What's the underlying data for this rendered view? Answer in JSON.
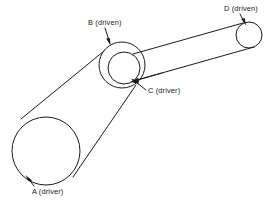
{
  "figure": {
    "type": "belt-drive-diagram",
    "background_color": "#ffffff",
    "line_color": "#1a1a1a",
    "width": 280,
    "height": 201
  },
  "labels": {
    "a": "A (driver)",
    "b": "B (driven)",
    "c": "C (driver)",
    "d": "D (driven)"
  },
  "pulleys": [
    {
      "id": "A",
      "label": "A (driver)",
      "role": "driver",
      "center_x": 46,
      "center_y": 151,
      "radius": 34
    },
    {
      "id": "B",
      "label": "B (driven)",
      "role": "driven",
      "center_x": 122,
      "center_y": 65,
      "radius": 23
    },
    {
      "id": "C",
      "label": "C (driver)",
      "role": "driver",
      "center_x": 124,
      "center_y": 68,
      "radius": 16
    },
    {
      "id": "D",
      "label": "D (driven)",
      "role": "driven",
      "center_x": 249,
      "center_y": 35,
      "radius": 13
    }
  ],
  "belts": [
    {
      "id": "belt-A-B",
      "from": "A",
      "to": "B",
      "upper_tangent": {
        "x1": 21,
        "y1": 119,
        "x2": 104,
        "y2": 51
      },
      "lower_tangent": {
        "x1": 73,
        "y1": 177,
        "x2": 136,
        "y2": 85
      }
    },
    {
      "id": "belt-C-D",
      "from": "C",
      "to": "D",
      "upper_tangent": {
        "x1": 133,
        "y1": 54,
        "x2": 243,
        "y2": 23
      },
      "lower_tangent": {
        "x1": 137,
        "y1": 80,
        "x2": 254,
        "y2": 47
      }
    }
  ],
  "leaders": [
    {
      "id": "leader-A",
      "label": "A (driver)",
      "text_x": 32,
      "text_y": 194,
      "line": {
        "x1": 34,
        "y1": 186,
        "x2": 27,
        "y2": 177
      },
      "arrow_at": {
        "x": 27,
        "y": 177
      },
      "arrow_angle": 232
    },
    {
      "id": "leader-B",
      "label": "B (driven)",
      "text_x": 88,
      "text_y": 25,
      "line": {
        "x1": 105,
        "y1": 28,
        "x2": 110,
        "y2": 43
      },
      "arrow_at": {
        "x": 110,
        "y": 43
      },
      "arrow_angle": 72
    },
    {
      "id": "leader-C",
      "label": "C (driver)",
      "text_x": 148,
      "text_y": 93,
      "line": {
        "x1": 146,
        "y1": 90,
        "x2": 133,
        "y2": 80
      },
      "arrow_at": {
        "x": 133,
        "y": 80
      },
      "arrow_angle": 218
    },
    {
      "id": "leader-C-inner",
      "label": "",
      "line": {
        "x1": 160,
        "y1": 74,
        "x2": 132,
        "y2": 82
      },
      "arrow_at": {
        "x": 132,
        "y": 82
      },
      "arrow_angle": 196
    },
    {
      "id": "leader-D",
      "label": "D (driven)",
      "text_x": 224,
      "text_y": 11,
      "line": {
        "x1": 240,
        "y1": 14,
        "x2": 245,
        "y2": 23
      },
      "arrow_at": {
        "x": 245,
        "y": 23
      },
      "arrow_angle": 62
    }
  ]
}
